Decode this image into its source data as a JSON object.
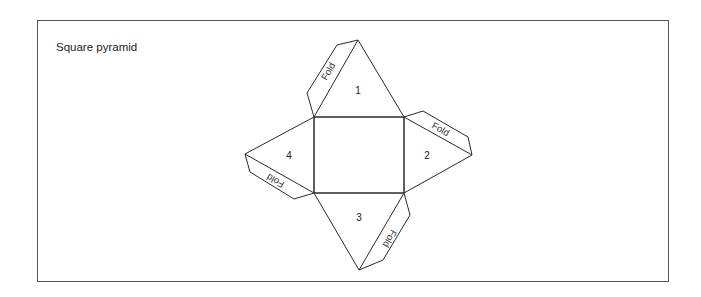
{
  "title": "Square pyramid",
  "faces": [
    {
      "id": "1",
      "label": "1"
    },
    {
      "id": "2",
      "label": "2"
    },
    {
      "id": "3",
      "label": "3"
    },
    {
      "id": "4",
      "label": "4"
    }
  ],
  "tabs": [
    {
      "label": "Fold"
    },
    {
      "label": "Fold"
    },
    {
      "label": "Fold"
    },
    {
      "label": "Fold"
    }
  ],
  "colors": {
    "line": "#2a2a2a",
    "background": "#ffffff"
  }
}
